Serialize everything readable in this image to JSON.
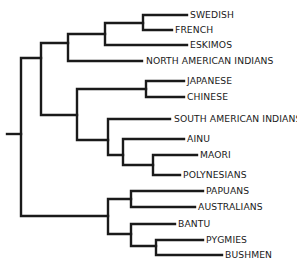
{
  "diagram": {
    "type": "phylogenetic-tree",
    "line_color": "#1a1a1a",
    "background": "#ffffff",
    "leaves": [
      {
        "label": "SWEDISH",
        "y": 15,
        "x_end": 187
      },
      {
        "label": "FRENCH",
        "y": 30,
        "x_end": 172
      },
      {
        "label": "ESKIMOS",
        "y": 45,
        "x_end": 187
      },
      {
        "label": "NORTH AMERICAN INDIANS",
        "y": 61,
        "x_end": 142
      },
      {
        "label": "JAPANESE",
        "y": 81,
        "x_end": 184
      },
      {
        "label": "CHINESE",
        "y": 97,
        "x_end": 184
      },
      {
        "label": "SOUTH AMERICAN INDIANS",
        "y": 119,
        "x_end": 170
      },
      {
        "label": "AINU",
        "y": 139,
        "x_end": 184
      },
      {
        "label": "MAORI",
        "y": 155,
        "x_end": 197
      },
      {
        "label": "POLYNESIANS",
        "y": 175,
        "x_end": 180
      },
      {
        "label": "PAPUANS",
        "y": 191,
        "x_end": 203
      },
      {
        "label": "AUSTRALIANS",
        "y": 207,
        "x_end": 195
      },
      {
        "label": "BANTU",
        "y": 224,
        "x_end": 175
      },
      {
        "label": "PYGMIES",
        "y": 240,
        "x_end": 203
      },
      {
        "label": "BUSHMEN",
        "y": 255,
        "x_end": 222
      }
    ]
  }
}
